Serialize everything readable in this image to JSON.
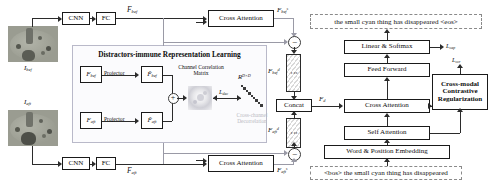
{
  "figure": {
    "panel_title": "Distractors-immune Representation Learning",
    "modules": {
      "cnn_top": "CNN",
      "fc_top": "FC",
      "cnn_bottom": "CNN",
      "fc_bottom": "FC",
      "cross_attention_top": "Cross Attention",
      "cross_attention_bottom": "Cross Attention",
      "projector_top": "Projector",
      "projector_bottom": "Projector",
      "concat": "Concat",
      "linear_softmax": "Linear & Softmax",
      "feed_forward": "Feed Forward",
      "cross_attention_dec": "Cross Attention",
      "self_attention": "Self Attention",
      "word_position_embedding": "Word & Position Embedding",
      "ccr": "Cross-modal\nContrastive\nRegularization",
      "ccr_line1": "Cross-modal",
      "ccr_line2": "Contrastive",
      "ccr_line3": "Regularization",
      "channel_correlation_matrix": "Channel Correlation",
      "channel_correlation_matrix2": "Matrix",
      "cross_channel_decorrelation_1": "Cross-channel",
      "cross_channel_decorrelation_2": "Decorrelation"
    },
    "text_io": {
      "output_caption": "the small cyan thing has disappeared <eos>",
      "input_caption": "<bos> the small cyan thing has disappeared"
    },
    "symbols": {
      "image_bef": "I",
      "image_bef_sub": "bef",
      "image_aft": "I",
      "image_aft_sub": "aft",
      "F_bef": "F",
      "F_bef_sub": "bef",
      "F_aft": "F",
      "F_aft_sub": "aft",
      "F_bef_s": "F",
      "F_bef_s_sub": "bef",
      "F_bef_s_sup": "s",
      "F_aft_s": "F",
      "F_aft_s_sub": "aft",
      "F_aft_s_sup": "s",
      "F_bef_d": "F",
      "F_bef_d_sub": "bef",
      "F_bef_d_sup": "d",
      "F_aft_d": "F",
      "F_aft_d_sub": "aft",
      "F_aft_d_sup": "d",
      "F_d": "F",
      "F_d_sub": "d",
      "Fhat_bef": "F̃",
      "Fhat_bef_sub": "bef",
      "Fhat_aft": "F̃",
      "Fhat_aft_sub": "aft",
      "loss_dec": "L",
      "loss_dec_sub": "dec",
      "loss_cap": "L",
      "loss_cap_sub": "cap",
      "loss_ccr": "L",
      "loss_ccr_sub": "ccr",
      "space_RDxD": "R",
      "space_RDxD_sup": "D×D",
      "minus": "−",
      "vdots": "⋮"
    },
    "colors": {
      "line": "#2b2b2b",
      "dashed_line": "#9a9aa6",
      "panel_border": "#b9b9c9",
      "box_border": "#1a1a1a",
      "caption_box_border": "#8a8a8a"
    }
  }
}
